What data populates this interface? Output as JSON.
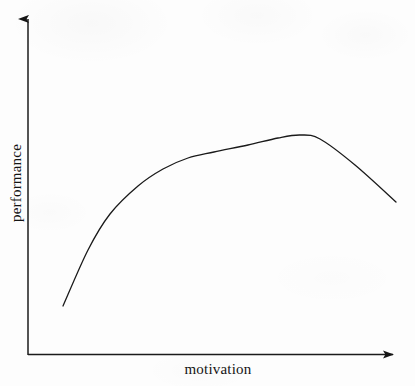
{
  "figure": {
    "background_color": "#fdfdfd",
    "ink_color": "#1a1a1a",
    "width": 415,
    "height": 386
  },
  "axes": {
    "y_axis_name": "performance",
    "x_axis_name": "motivation",
    "origin": {
      "x": 28,
      "y": 355
    },
    "y_axis_top": {
      "x": 28,
      "y": 10
    },
    "x_axis_right": {
      "x": 403,
      "y": 354
    },
    "arrowheads": "both",
    "ticks_shown": false,
    "grid_shown": false
  },
  "chart_data": {
    "type": "line",
    "title": "",
    "subtitle": "",
    "xlabel": "motivation",
    "ylabel": "performance",
    "xlim": [
      0,
      1
    ],
    "ylim": [
      0,
      1
    ],
    "grid": false,
    "legend": null,
    "annotations": [],
    "tick_labels": {
      "x": [],
      "y": []
    },
    "series": [
      {
        "name": "performance",
        "color": "#1a1a1a",
        "line_width": 1.3,
        "description": "inverted-U curve: rises steeply, bends at a knee, plateaus to a rounded peak, then falls off",
        "x": [
          0.0,
          0.08,
          0.14,
          0.24,
          0.35,
          0.46,
          0.52,
          0.63,
          0.73,
          0.8,
          0.86,
          0.93,
          1.0
        ],
        "y": [
          0.0,
          0.24,
          0.37,
          0.53,
          0.65,
          0.73,
          0.77,
          0.82,
          0.86,
          0.88,
          0.87,
          0.77,
          0.6
        ],
        "pixel_points": [
          {
            "x": 63,
            "y": 306
          },
          {
            "x": 88,
            "y": 250
          },
          {
            "x": 110,
            "y": 214
          },
          {
            "x": 138,
            "y": 186
          },
          {
            "x": 163,
            "y": 169
          },
          {
            "x": 188,
            "y": 158
          },
          {
            "x": 214,
            "y": 152
          },
          {
            "x": 248,
            "y": 145
          },
          {
            "x": 278,
            "y": 138
          },
          {
            "x": 300,
            "y": 135
          },
          {
            "x": 320,
            "y": 139
          },
          {
            "x": 355,
            "y": 165
          },
          {
            "x": 396,
            "y": 202
          }
        ]
      }
    ]
  }
}
